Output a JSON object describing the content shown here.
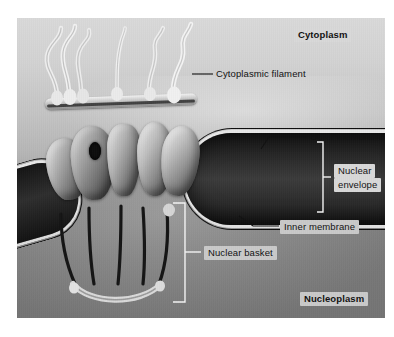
{
  "regions": {
    "cytoplasm": {
      "label": "Cytoplasm"
    },
    "nucleoplasm": {
      "label": "Nucleoplasm"
    }
  },
  "labels": {
    "cytoplasmic_filament": "Cytoplasmic filament",
    "outer_membrane": "Outer membrane",
    "nuclear_envelope_line1": "Nuclear",
    "nuclear_envelope_line2": "envelope",
    "inner_membrane": "Inner membrane",
    "nuclear_basket": "Nuclear basket"
  },
  "colors": {
    "cytoplasm_bg": "#c8c8c8",
    "nucleoplasm_bg": "#8a8a8a",
    "membrane_light": "#e6e6e6",
    "lumen_dark": "#1a1a1a",
    "label_text": "#111111",
    "label_box": "#d8d8d8",
    "page_bg": "#ffffff"
  },
  "structures": {
    "cytoplasmic_filaments_count": 5,
    "spoke_subunits_count": 5,
    "basket_fibrils_count": 5
  }
}
